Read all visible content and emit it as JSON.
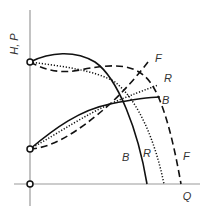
{
  "diagram": {
    "y_axis_label": "H, P",
    "x_axis_label": "Q",
    "curve_labels": {
      "head_F": "F",
      "head_R": "R",
      "head_B": "B",
      "power_F": "F",
      "power_R": "R",
      "power_B": "B"
    },
    "legend_styles": {
      "B": "solid",
      "R": "dotted",
      "F": "dashed"
    },
    "nodes": [
      "shutoff-head-point",
      "shutoff-power-point",
      "origin-point"
    ]
  }
}
